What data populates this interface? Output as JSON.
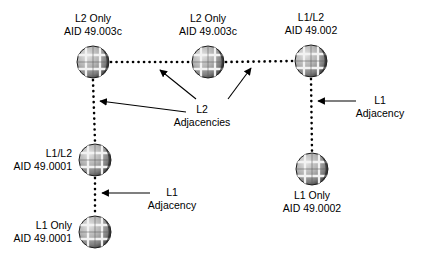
{
  "diagram": {
    "type": "network-topology",
    "canvas": {
      "width": 434,
      "height": 260
    },
    "colors": {
      "background": "#ffffff",
      "line": "#000000",
      "text": "#000000",
      "node_light": "#d8d8d8",
      "node_mid": "#9a9a9a",
      "node_dark": "#2b2b2b"
    },
    "nodes": [
      {
        "id": "r1",
        "icon": "router-sphere-icon",
        "cx": 93,
        "cy": 62,
        "r": 16,
        "label_position": "above",
        "level": "L2 Only",
        "aid": "AID 49.003c"
      },
      {
        "id": "r2",
        "icon": "router-sphere-icon",
        "cx": 208,
        "cy": 62,
        "r": 16,
        "label_position": "above",
        "level": "L2 Only",
        "aid": "AID 49.003c"
      },
      {
        "id": "r3",
        "icon": "router-sphere-icon",
        "cx": 311,
        "cy": 61,
        "r": 16,
        "label_position": "above",
        "level": "L1/L2",
        "aid": "AID 49.002"
      },
      {
        "id": "r4",
        "icon": "router-sphere-icon",
        "cx": 95,
        "cy": 160,
        "r": 16,
        "label_position": "left",
        "level": "L1/L2",
        "aid": "AID 49.0001"
      },
      {
        "id": "r5",
        "icon": "router-sphere-icon",
        "cx": 95,
        "cy": 232,
        "r": 16,
        "label_position": "left",
        "level": "L1 Only",
        "aid": "AID 49.0001"
      },
      {
        "id": "r6",
        "icon": "router-sphere-icon",
        "cx": 312,
        "cy": 169,
        "r": 16,
        "label_position": "below",
        "level": "L1 Only",
        "aid": "AID 49.0002"
      }
    ],
    "links": [
      {
        "id": "l-r1-r2",
        "from": "r1",
        "to": "r2",
        "style": "dotted",
        "orientation": "horizontal"
      },
      {
        "id": "l-r2-r3",
        "from": "r2",
        "to": "r3",
        "style": "dotted",
        "orientation": "horizontal"
      },
      {
        "id": "l-r1-r4",
        "from": "r1",
        "to": "r4",
        "style": "dotted",
        "orientation": "vertical"
      },
      {
        "id": "l-r4-r5",
        "from": "r4",
        "to": "r5",
        "style": "dotted",
        "orientation": "vertical"
      },
      {
        "id": "l-r3-r6",
        "from": "r3",
        "to": "r6",
        "style": "dotted",
        "orientation": "vertical"
      }
    ],
    "annotations": [
      {
        "id": "a-l2",
        "line1": "L2",
        "line2": "Adjacencies",
        "x": 202,
        "y": 104,
        "leader_count": 3,
        "targets": [
          "l-r1-r4",
          "l-r1-r2",
          "l-r2-r3"
        ]
      },
      {
        "id": "a-l1-right",
        "line1": "L1",
        "line2": "Adjacency",
        "x": 380,
        "y": 95,
        "leader_count": 1,
        "targets": [
          "l-r3-r6"
        ]
      },
      {
        "id": "a-l1-left",
        "line1": "L1",
        "line2": "Adjacency",
        "x": 172,
        "y": 188,
        "leader_count": 1,
        "targets": [
          "l-r4-r5"
        ]
      }
    ]
  }
}
